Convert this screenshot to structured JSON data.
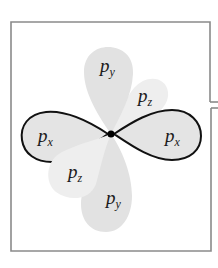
{
  "figure": {
    "colors": {
      "frame": "#8a8a8a",
      "px_fill": "#e4e4e4",
      "py_fill": "#e2e2e2",
      "pz_fill": "#eeeeee",
      "outline": "#111111",
      "nucleus": "#000000"
    },
    "labels": {
      "px_left": {
        "main": "p",
        "sub": "x"
      },
      "px_right": {
        "main": "p",
        "sub": "x"
      },
      "py_top": {
        "main": "p",
        "sub": "y"
      },
      "py_bottom": {
        "main": "p",
        "sub": "y"
      },
      "pz_upper": {
        "main": "p",
        "sub": "z"
      },
      "pz_lower": {
        "main": "p",
        "sub": "z"
      }
    }
  }
}
